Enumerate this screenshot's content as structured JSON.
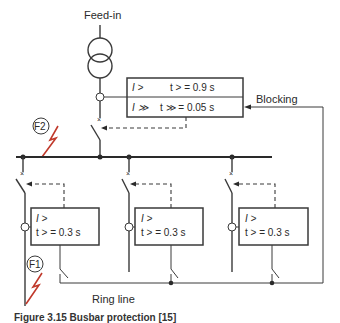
{
  "diagram": {
    "title_label": "Feed-in",
    "incomer_relay": {
      "row1": {
        "element": "I >",
        "setting": "t > = 0.9 s"
      },
      "row2": {
        "element": "I ≫",
        "setting": "t ≫ = 0.05 s"
      }
    },
    "blocking_label": "Blocking",
    "fault_labels": {
      "f1": "F1",
      "f2": "F2"
    },
    "feeder_relays": [
      {
        "element": "I >",
        "setting": "t > = 0.3 s"
      },
      {
        "element": "I >",
        "setting": "t > = 0.3 s"
      },
      {
        "element": "I >",
        "setting": "t > = 0.3 s"
      }
    ],
    "ring_line_label": "Ring line",
    "caption": "Figure 3.15   Busbar protection [15]",
    "colors": {
      "line": "#3a3a3a",
      "fault": "#c0392b",
      "background": "#ffffff"
    }
  }
}
